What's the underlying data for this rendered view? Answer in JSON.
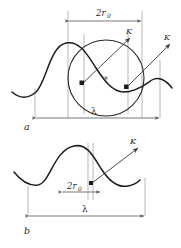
{
  "figure": {
    "title": "",
    "background_color": "#ffffff",
    "stroke_color": "#1c1c1c",
    "guide_color": "#b0b0b0",
    "dimension_color": "#555555"
  },
  "panels": [
    {
      "id": "a",
      "letter": "a",
      "labels": {
        "diameter": "2r",
        "diameter_sub": "0",
        "wavelength": "λ",
        "vector_inner": "K",
        "vector_outer": "K"
      }
    },
    {
      "id": "b",
      "letter": "b",
      "labels": {
        "diameter": "2r",
        "diameter_sub": "0",
        "wavelength": "λ",
        "vector": "K"
      }
    }
  ],
  "icons": {
    "arrow": "arrow-head",
    "point_marker": "square-point-marker",
    "center_marker": "circle-center-dot"
  }
}
